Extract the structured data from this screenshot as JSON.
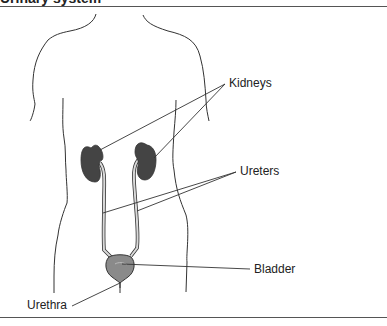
{
  "figure": {
    "title_clipped": "Urinary system",
    "colors": {
      "outline": "#333333",
      "kidney": "#444444",
      "bladder": "#8a8a8a",
      "ureter_fill": "#d9d9d9",
      "leader_line": "#333333",
      "rule": "#555555"
    }
  },
  "labels": {
    "kidneys": "Kidneys",
    "ureters": "Ureters",
    "bladder": "Bladder",
    "urethra": "Urethra"
  }
}
